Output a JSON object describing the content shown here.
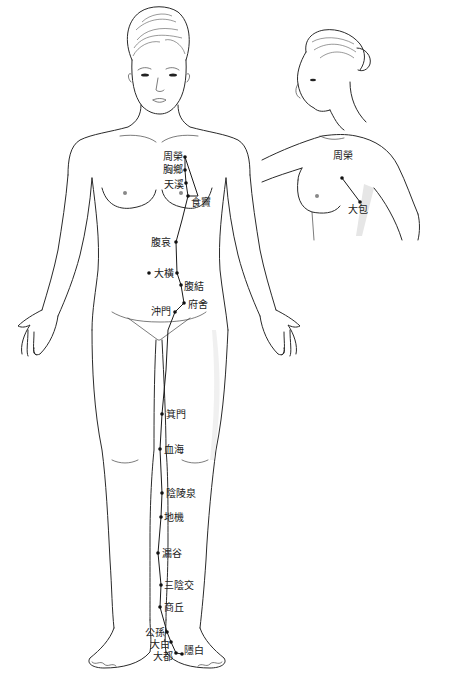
{
  "figure": {
    "line_color": "#2a2a2a",
    "point_color": "#111111",
    "background": "#ffffff"
  },
  "front_view": {
    "points": [
      {
        "label": "周榮",
        "x": 185,
        "y": 157,
        "lx": 163,
        "ly": 151
      },
      {
        "label": "胸鄉",
        "x": 185,
        "y": 170,
        "lx": 163,
        "ly": 164
      },
      {
        "label": "天溪",
        "x": 186,
        "y": 183,
        "lx": 164,
        "ly": 179
      },
      {
        "label": "食竇",
        "x": 188,
        "y": 196,
        "lx": 191,
        "ly": 197
      },
      {
        "label": "腹哀",
        "x": 176,
        "y": 242,
        "lx": 151,
        "ly": 237
      },
      {
        "label": "大橫",
        "x": 177,
        "y": 273,
        "lx": 154,
        "ly": 268
      },
      {
        "label": "腹結",
        "x": 181,
        "y": 285,
        "lx": 184,
        "ly": 281
      },
      {
        "label": "府舍",
        "x": 184,
        "y": 303,
        "lx": 188,
        "ly": 299
      },
      {
        "label": "沖門",
        "x": 175,
        "y": 312,
        "lx": 151,
        "ly": 306
      },
      {
        "label": "箕門",
        "x": 162,
        "y": 414,
        "lx": 166,
        "ly": 409
      },
      {
        "label": "血海",
        "x": 160,
        "y": 449,
        "lx": 164,
        "ly": 444
      },
      {
        "label": "陰陵泉",
        "x": 162,
        "y": 493,
        "lx": 166,
        "ly": 488
      },
      {
        "label": "地機",
        "x": 161,
        "y": 517,
        "lx": 164,
        "ly": 512
      },
      {
        "label": "漏谷",
        "x": 158,
        "y": 553,
        "lx": 162,
        "ly": 548
      },
      {
        "label": "三陰交",
        "x": 161,
        "y": 585,
        "lx": 164,
        "ly": 580
      },
      {
        "label": "商丘",
        "x": 160,
        "y": 607,
        "lx": 164,
        "ly": 602
      },
      {
        "label": "公孫",
        "x": 167,
        "y": 632,
        "lx": 145,
        "ly": 627
      },
      {
        "label": "大白",
        "x": 171,
        "y": 642,
        "lx": 150,
        "ly": 639
      },
      {
        "label": "大都",
        "x": 176,
        "y": 653,
        "lx": 153,
        "ly": 651
      },
      {
        "label": "隱白",
        "x": 182,
        "y": 654,
        "lx": 184,
        "ly": 645
      }
    ],
    "extra_point": {
      "label": "大橫-side-dot",
      "x": 149,
      "y": 273
    }
  },
  "side_view": {
    "points": [
      {
        "label": "周榮",
        "x": 342,
        "y": 178,
        "lx": 333,
        "ly": 150
      },
      {
        "label": "大包",
        "x": 360,
        "y": 202,
        "lx": 348,
        "ly": 204
      }
    ]
  }
}
